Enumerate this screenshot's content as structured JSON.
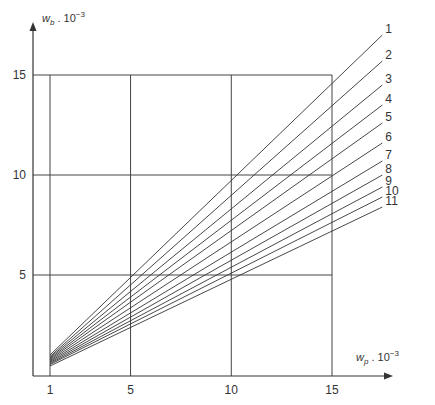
{
  "chart_data": {
    "type": "line",
    "title": "",
    "xlabel": "w_p · 10^-3",
    "ylabel": "w_b · 10^-3",
    "xlabel_parts": {
      "var": "w",
      "sub": "p",
      "mult": " . 10",
      "exp": "−3"
    },
    "ylabel_parts": {
      "var": "w",
      "sub": "b",
      "mult": " . 10",
      "exp": "−3"
    },
    "xlim": [
      0,
      17.5
    ],
    "ylim": [
      0,
      17.5
    ],
    "x_ticks": [
      1,
      5,
      10,
      15
    ],
    "y_ticks": [
      5,
      10,
      15
    ],
    "x_tick_labels": [
      "1",
      "5",
      "10",
      "15"
    ],
    "y_tick_labels": [
      "5",
      "10",
      "15"
    ],
    "grid": true,
    "legend": "inline labels at right end of each line",
    "series": [
      {
        "name": "1",
        "x": [
          1,
          17.5
        ],
        "y": [
          0.9,
          17.0
        ]
      },
      {
        "name": "2",
        "x": [
          1,
          17.5
        ],
        "y": [
          0.85,
          15.7
        ]
      },
      {
        "name": "3",
        "x": [
          1,
          17.5
        ],
        "y": [
          0.8,
          14.5
        ]
      },
      {
        "name": "4",
        "x": [
          1,
          17.5
        ],
        "y": [
          0.75,
          13.5
        ]
      },
      {
        "name": "5",
        "x": [
          1,
          17.5
        ],
        "y": [
          0.7,
          12.6
        ]
      },
      {
        "name": "6",
        "x": [
          1,
          17.5
        ],
        "y": [
          0.65,
          11.6
        ]
      },
      {
        "name": "7",
        "x": [
          1,
          17.5
        ],
        "y": [
          0.6,
          10.7
        ]
      },
      {
        "name": "8",
        "x": [
          1,
          17.5
        ],
        "y": [
          0.55,
          10.0
        ]
      },
      {
        "name": "9",
        "x": [
          1,
          17.5
        ],
        "y": [
          0.5,
          9.4
        ]
      },
      {
        "name": "10",
        "x": [
          1,
          17.5
        ],
        "y": [
          0.45,
          8.9
        ]
      },
      {
        "name": "11",
        "x": [
          1,
          17.5
        ],
        "y": [
          0.4,
          8.4
        ]
      }
    ]
  },
  "colors": {
    "axis": "#333333",
    "grid": "#444444",
    "line": "#333333"
  }
}
